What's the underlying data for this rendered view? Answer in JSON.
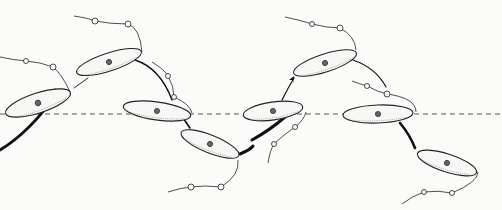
{
  "figure": {
    "background": "#fbfbfa",
    "ink": "#222222",
    "axis": {
      "y": 114,
      "x1": 0,
      "x2": 502
    },
    "cells": [
      {
        "id": 1,
        "cx": 38,
        "cy": 103,
        "rx": 34,
        "ry": 10,
        "rot": -18
      },
      {
        "id": 2,
        "cx": 109,
        "cy": 62,
        "rx": 34,
        "ry": 9,
        "rot": -18
      },
      {
        "id": 3,
        "cx": 157,
        "cy": 111,
        "rx": 34,
        "ry": 9,
        "rot": 8
      },
      {
        "id": 4,
        "cx": 210,
        "cy": 144,
        "rx": 31,
        "ry": 9,
        "rot": 22
      },
      {
        "id": 5,
        "cx": 273,
        "cy": 111,
        "rx": 30,
        "ry": 9,
        "rot": -8
      },
      {
        "id": 6,
        "cx": 325,
        "cy": 63,
        "rx": 33,
        "ry": 9,
        "rot": -18
      },
      {
        "id": 7,
        "cx": 378,
        "cy": 114,
        "rx": 35,
        "ry": 9,
        "rot": -2
      },
      {
        "id": 8,
        "cx": 447,
        "cy": 163,
        "rx": 31,
        "ry": 9,
        "rot": 18
      }
    ],
    "flagella_beads": [
      [
        26,
        61
      ],
      [
        53,
        67
      ],
      [
        95,
        21
      ],
      [
        128,
        24
      ],
      [
        168,
        76
      ],
      [
        174,
        97
      ],
      [
        191,
        187
      ],
      [
        221,
        187
      ],
      [
        312,
        24
      ],
      [
        340,
        28
      ],
      [
        295,
        127
      ],
      [
        274,
        144
      ],
      [
        367,
        86
      ],
      [
        387,
        94
      ],
      [
        424,
        192
      ],
      [
        452,
        193
      ]
    ],
    "trajectory_arrows": [
      {
        "from": "left-edge",
        "to": "cell-1",
        "weight": "heavy"
      },
      {
        "from": "cell-4",
        "to": "cell-5",
        "weight": "heavy"
      },
      {
        "from": "cell-5",
        "to": "cell-6",
        "weight": "medium"
      },
      {
        "from": "cell-7",
        "to": "cell-8",
        "weight": "heavy"
      }
    ]
  }
}
